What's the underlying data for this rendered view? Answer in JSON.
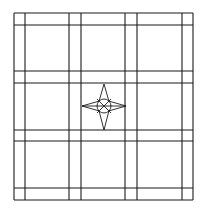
{
  "diagram": {
    "type": "tile-grid-pattern",
    "background": "#ffffff",
    "stroke_color": "#1a1a1a",
    "frame": {
      "x": 14,
      "y": 13,
      "width": 179,
      "height": 187
    },
    "vertical_lines_x": [
      14,
      25,
      69,
      81,
      125,
      137,
      182,
      193
    ],
    "horizontal_lines_y": [
      13,
      25,
      71,
      83,
      130,
      141,
      188,
      200
    ],
    "center_motif": {
      "name": "four-point-star",
      "center": [
        104,
        106
      ],
      "top": [
        104,
        84
      ],
      "bottom": [
        104,
        130
      ],
      "left": [
        82,
        106
      ],
      "right": [
        126,
        106
      ],
      "circle_radius": 7
    }
  }
}
